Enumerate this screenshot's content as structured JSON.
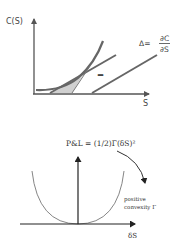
{
  "top_diagram": {
    "y_axis_label": "C(S)",
    "x_axis_label": "S",
    "minus_sign": "–",
    "delta_formula": {
      "lhs": "Δ=",
      "numerator": "∂C",
      "denominator": "∂S"
    },
    "colors": {
      "axis": "#555555",
      "curve": "#666666",
      "shade": "#d0d0d0"
    }
  },
  "bottom_diagram": {
    "formula": "P&L = (1/2)Γ(δS)²",
    "x_axis_label": "δS",
    "annotation_line1": "positive",
    "annotation_line2": "convexity Γ",
    "colors": {
      "axis": "#222222",
      "parabola": "#777777"
    }
  }
}
